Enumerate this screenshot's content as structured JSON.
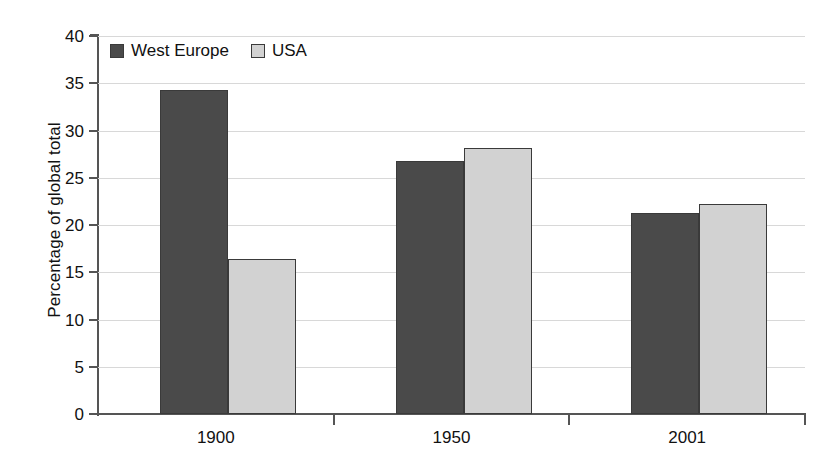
{
  "chart_data": {
    "type": "bar",
    "title": "",
    "xlabel": "",
    "ylabel": "Percentage of global total",
    "categories": [
      "1900",
      "1950",
      "2001"
    ],
    "series": [
      {
        "name": "West Europe",
        "color": "#4a4a4a",
        "values": [
          34.3,
          26.8,
          21.3
        ]
      },
      {
        "name": "USA",
        "color": "#d2d2d2",
        "values": [
          16.4,
          28.1,
          22.2
        ]
      }
    ],
    "ylim": [
      0,
      40
    ],
    "ytick_step": 5,
    "yticks": [
      0,
      5,
      10,
      15,
      20,
      25,
      30,
      35,
      40
    ],
    "ytick_labels": [
      "0",
      "5",
      "10",
      "15",
      "20",
      "25",
      "30",
      "35",
      "40"
    ],
    "grid": true,
    "grid_axis": "y",
    "legend_position": "top-left-inside"
  }
}
